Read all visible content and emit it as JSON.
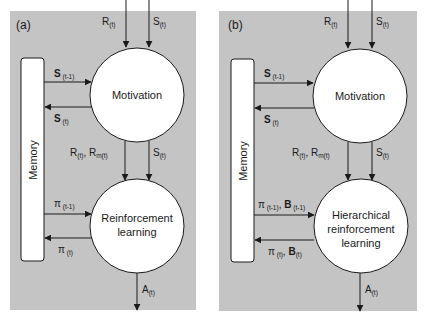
{
  "colors": {
    "panel_bg": "#c4c4c4",
    "node_fill": "#ffffff",
    "stroke": "#1a1a1a",
    "page_bg": "#ffffff"
  },
  "panels": [
    {
      "id": "a",
      "label": "(a)",
      "memory_label": "Memory",
      "top_node": "Motivation",
      "bottom_node_lines": [
        "Reinforcement",
        "learning"
      ],
      "inputs": {
        "reward": {
          "main": "R",
          "sub": "(t)"
        },
        "state": {
          "main": "S",
          "sub": "(t)"
        }
      },
      "memory_to_motivation": {
        "main": "S",
        "sub": " (t-1)"
      },
      "motivation_to_memory": {
        "main": "S",
        "sub": " (t)"
      },
      "motivation_to_rl_left": {
        "r": "R",
        "r_sub": "(t)",
        "sep": ", ",
        "rm": "R",
        "rm_sub": "m(t)"
      },
      "motivation_to_rl_right": {
        "main": "S",
        "sub": "(t)"
      },
      "memory_to_rl": {
        "main": "π",
        "sub": " (t-1)"
      },
      "rl_to_memory": {
        "main": "π",
        "sub": " (t)"
      },
      "output": {
        "main": "A",
        "sub": "(t)"
      }
    },
    {
      "id": "b",
      "label": "(b)",
      "memory_label": "Memory",
      "top_node": "Motivation",
      "bottom_node_lines": [
        "Hierarchical",
        "reinforcement",
        "learning"
      ],
      "inputs": {
        "reward": {
          "main": "R",
          "sub": "(t)"
        },
        "state": {
          "main": "S",
          "sub": "(t)"
        }
      },
      "memory_to_motivation": {
        "main": "S",
        "sub": " (t-1)"
      },
      "motivation_to_memory": {
        "main": "S",
        "sub": " (t)"
      },
      "motivation_to_rl_left": {
        "r": "R",
        "r_sub": "(t)",
        "sep": ", ",
        "rm": "R",
        "rm_sub": "m(t)"
      },
      "motivation_to_rl_right": {
        "main": "S",
        "sub": "(t)"
      },
      "memory_to_rl": {
        "main": "π",
        "sub": " (t-1)",
        "sep": ", ",
        "b": "B",
        "b_sub": " (t-1)"
      },
      "rl_to_memory": {
        "main": "π",
        "sub": " (t)",
        "sep": ", ",
        "b": "B",
        "b_sub": "(t)"
      },
      "output": {
        "main": "A",
        "sub": "(t)"
      }
    }
  ]
}
